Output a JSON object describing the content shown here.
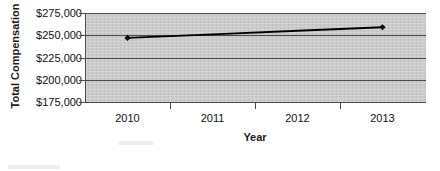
{
  "chart_data": {
    "type": "line",
    "title": "",
    "xlabel": "Year",
    "ylabel": "Total Compensation",
    "categories": [
      "2010",
      "2011",
      "2012",
      "2013"
    ],
    "series": [
      {
        "name": "Total Compensation",
        "values": [
          247000,
          251000,
          255000,
          259000
        ],
        "marker_points": [
          {
            "category": "2010",
            "value": 247000
          },
          {
            "category": "2013",
            "value": 259000
          }
        ]
      }
    ],
    "ylim": [
      175000,
      275000
    ],
    "ytick_labels": [
      "$175,000",
      "$200,000",
      "$225,000",
      "$250,000",
      "$275,000"
    ],
    "ytick_values": [
      175000,
      200000,
      225000,
      250000,
      275000
    ],
    "grid": true,
    "legend": false,
    "legend_position": "none",
    "plot_background_color": "#cccccc",
    "line_color": "#000000",
    "marker_color": "#000000",
    "marker_shape": "diamond",
    "gridline_color": "#4a4a4a"
  }
}
